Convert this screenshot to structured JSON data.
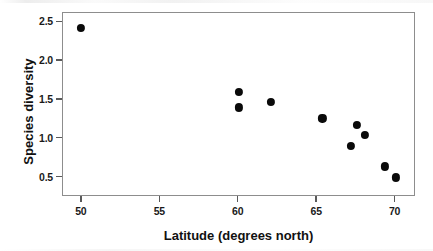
{
  "chart_data": {
    "type": "scatter",
    "title": "",
    "xlabel": "Latitude (degrees north)",
    "ylabel": "Species diversity",
    "xlim": [
      48.8,
      71.3
    ],
    "ylim": [
      0.25,
      2.62
    ],
    "xticks": [
      "50",
      "55",
      "60",
      "65",
      "70"
    ],
    "xtick_values": [
      50,
      55,
      60,
      65,
      70
    ],
    "yticks": [
      "0.5",
      "1.0",
      "1.5",
      "2.0",
      "2.5"
    ],
    "ytick_values": [
      0.5,
      1.0,
      1.5,
      2.0,
      2.5
    ],
    "grid": false,
    "legend": false,
    "marker": "filled-circle",
    "marker_color": "#0a0a0a",
    "frame_color": "#8d8d8d",
    "background": "#ffffff",
    "points": [
      {
        "x": 50.0,
        "y": 2.42
      },
      {
        "x": 60.1,
        "y": 1.59
      },
      {
        "x": 60.1,
        "y": 1.39
      },
      {
        "x": 62.1,
        "y": 1.46
      },
      {
        "x": 65.4,
        "y": 1.25
      },
      {
        "x": 67.2,
        "y": 0.9
      },
      {
        "x": 67.6,
        "y": 1.17
      },
      {
        "x": 68.1,
        "y": 1.04
      },
      {
        "x": 69.4,
        "y": 0.63
      },
      {
        "x": 70.1,
        "y": 0.49
      }
    ]
  }
}
